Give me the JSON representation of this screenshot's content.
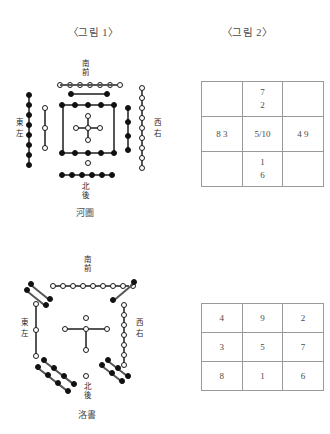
{
  "figures": {
    "fig1_label": "〈그림 1〉",
    "fig2_label": "〈그림 2〉"
  },
  "hetu": {
    "caption": "河圖",
    "directions": {
      "south": "南",
      "front": "前",
      "north": "北",
      "back": "後",
      "east": "東",
      "left": "左",
      "west": "西",
      "right": "右"
    },
    "groups": {
      "top_white": 7,
      "top_black": 2,
      "bottom_white": 1,
      "bottom_black": 6,
      "left_black": 8,
      "left_white": 3,
      "right_white": 9,
      "right_black": 4,
      "center_black_square": 10,
      "center_white_cross": 5
    }
  },
  "luoshu": {
    "caption": "洛書",
    "directions": {
      "south": "南",
      "front": "前",
      "north": "北",
      "back": "後",
      "east": "東",
      "left": "左",
      "west": "西",
      "right": "右"
    },
    "groups": {
      "top_white": 9,
      "top_left_black": 4,
      "top_right_black": 2,
      "left_white": 3,
      "right_white": 7,
      "bottom_left_black": 8,
      "bottom_right_black": 6,
      "bottom_white": 1,
      "center_white": 5
    }
  },
  "table_hetu": {
    "rows": [
      [
        "",
        "7\n2",
        ""
      ],
      [
        "8 3",
        "5/10",
        "4 9"
      ],
      [
        "",
        "1\n6",
        ""
      ]
    ],
    "cells": {
      "r0c0": "",
      "r0c1_a": "7",
      "r0c1_b": "2",
      "r0c2": "",
      "r1c0": "8 3",
      "r1c1": "5/10",
      "r1c2": "4 9",
      "r2c0": "",
      "r2c1_a": "1",
      "r2c1_b": "6",
      "r2c2": ""
    }
  },
  "table_luoshu": {
    "cells": {
      "r0c0": "4",
      "r0c1": "9",
      "r0c2": "2",
      "r1c0": "3",
      "r1c1": "5",
      "r1c2": "7",
      "r2c0": "8",
      "r2c1": "1",
      "r2c2": "6"
    }
  }
}
